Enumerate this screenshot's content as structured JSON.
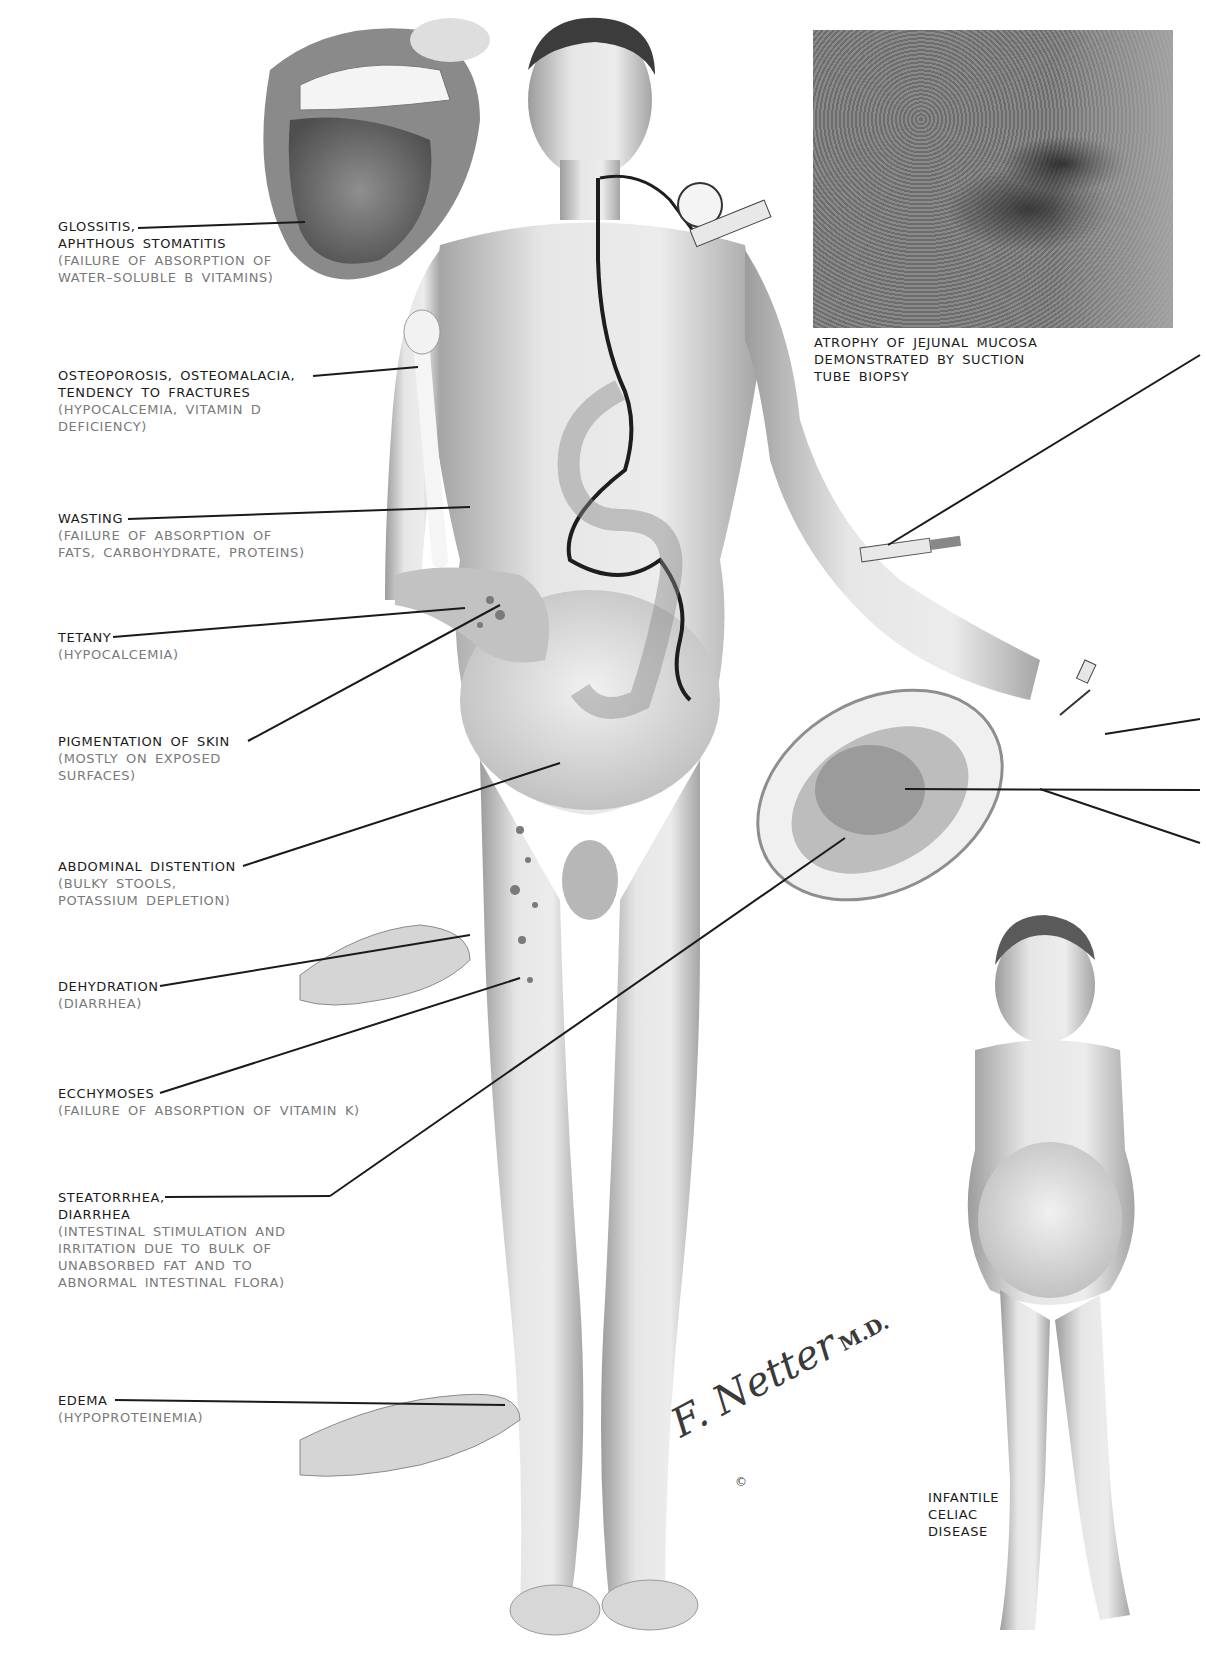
{
  "figure": {
    "type": "medical illustration",
    "signature": "F. Netter",
    "signature_suffix": "M.D.",
    "copyright_mark": "©"
  },
  "left_labels": [
    {
      "title": "GLOSSITIS,\nAPHTHOUS STOMATITIS",
      "detail": "(FAILURE OF ABSORPTION OF\nWATER–SOLUBLE B VITAMINS)"
    },
    {
      "title": "OSTEOPOROSIS, OSTEOMALACIA,\nTENDENCY TO FRACTURES",
      "detail": "(HYPOCALCEMIA, VITAMIN D\nDEFICIENCY)"
    },
    {
      "title": "WASTING",
      "detail": "(FAILURE OF ABSORPTION OF\nFATS, CARBOHYDRATE, PROTEINS)"
    },
    {
      "title": "TETANY",
      "detail": "(HYPOCALCEMIA)"
    },
    {
      "title": "PIGMENTATION OF SKIN",
      "detail": "(MOSTLY ON EXPOSED\nSURFACES)"
    },
    {
      "title": "ABDOMINAL DISTENTION",
      "detail": "(BULKY STOOLS,\nPOTASSIUM DEPLETION)"
    },
    {
      "title": "DEHYDRATION",
      "detail": "(DIARRHEA)"
    },
    {
      "title": "ECCHYMOSES",
      "detail": "(FAILURE OF ABSORPTION OF VITAMIN K)"
    },
    {
      "title": "STEATORRHEA,\nDIARRHEA",
      "detail": "(INTESTINAL STIMULATION AND\nIRRITATION DUE TO BULK OF\nUNABSORBED FAT AND TO\nABNORMAL INTESTINAL FLORA)"
    },
    {
      "title": "EDEMA",
      "detail": "(HYPOPROTEINEMIA)"
    }
  ],
  "captions": {
    "biopsy": "ATROPHY OF JEJUNAL MUCOSA\nDEMONSTRATED BY SUCTION\nTUBE BIOPSY",
    "infant": "INFANTILE\nCELIAC\nDISEASE"
  },
  "colors": {
    "label_title": "#1b1b1b",
    "label_detail": "#7a7a7a",
    "leader_line": "#1a1a1a",
    "skin_shade": "#c9c9c9"
  }
}
